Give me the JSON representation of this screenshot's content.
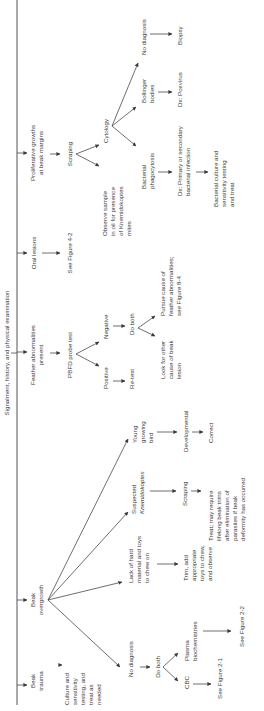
{
  "diagram": {
    "title": "Signalment, history, and physical examination",
    "colors": {
      "line": "#4a4a4a",
      "text": "#3a3a3a",
      "background": "#ffffff"
    },
    "branches": {
      "beak_trauma": {
        "label": [
          "Beak",
          "trauma"
        ],
        "next": [
          "Culture and",
          "sensitivity",
          "testing, and",
          "treat as",
          "needed"
        ]
      },
      "beak_overgrowth": {
        "label": [
          "Beak",
          "overgrowth"
        ],
        "no_diagnosis": {
          "label": "No diagnosis",
          "do_both": "Do both",
          "cbc": "CBC",
          "cbc_ref": "See Figure 2-1",
          "plasma": [
            "Plasma",
            "biochemistries"
          ],
          "plasma_ref": "See Figure 2-2"
        },
        "lack_material": {
          "label": [
            "Lack of hard",
            "material and toys",
            "to chew on"
          ],
          "next": [
            "Trim, add",
            "appropriate",
            "toys to chew,",
            "and observe"
          ]
        },
        "knemidokoptes": {
          "label": [
            "Suspected",
            "Knemidokoptes"
          ],
          "scraping": "Scraping",
          "treat": [
            "Treat; may require",
            "lifelong beak trims",
            "after elimination of",
            "parasites if beak",
            "deformity has occurred"
          ]
        },
        "young_bird": {
          "label": [
            "Young",
            "growing",
            "bird"
          ],
          "developmental": "Developmental",
          "correct": "Correct"
        }
      },
      "feather": {
        "label": [
          "Feather abnormalities",
          "present"
        ],
        "pbfd": "PBFD probe test",
        "positive": "Positive",
        "retest": "Re-test",
        "negative": "Negative",
        "do_both": "Do both",
        "look_other": [
          "Look for other",
          "cause of beak",
          "lesion"
        ],
        "pursue": [
          "Pursue cause of",
          "feather abnormalities;",
          "see Figure 8-4"
        ]
      },
      "oral": {
        "label": "Oral lesions",
        "ref": "See Figure 4-2"
      },
      "proliferative": {
        "label": [
          "Proliferative growths",
          "at beak margins"
        ],
        "scraping": "Scraping",
        "observe": [
          "Observe sample",
          "in oil for presence",
          "of Knemidokoptes",
          "mites"
        ],
        "cytology": "Cytology",
        "bacterial": [
          "Bacterial",
          "phagocytosis"
        ],
        "bacterial_dx": [
          "Dx: Primary or secondary",
          "bacterial infection"
        ],
        "bacterial_tx": [
          "Bacterial culture and",
          "sensitivity testing",
          "and treat"
        ],
        "bollinger": [
          "Bollinger",
          "bodies"
        ],
        "poxvirus": "Dx: Poxvirus",
        "no_diagnosis": "No diagnosis",
        "biopsy": "Biopsy"
      }
    }
  }
}
